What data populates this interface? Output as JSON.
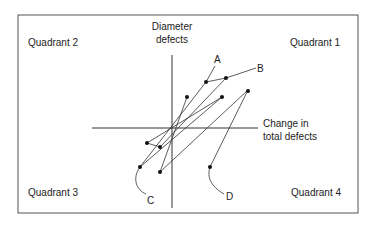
{
  "quadrants": {
    "q1": "Quadrant 1",
    "q2": "Quadrant 2",
    "q3": "Quadrant 3",
    "q4": "Quadrant 4"
  },
  "axes": {
    "y_label_1": "Diameter",
    "y_label_2": "defects",
    "x_label_1": "Change in",
    "x_label_2": "total defects"
  },
  "callouts": {
    "a": "A",
    "b": "B",
    "c": "C",
    "d": "D"
  }
}
